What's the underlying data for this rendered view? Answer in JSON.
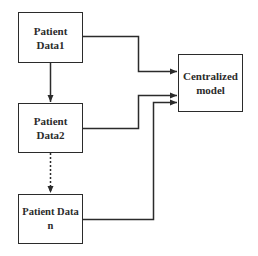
{
  "diagram": {
    "type": "flowchart",
    "nodes": [
      {
        "id": "patient_data_1",
        "label": "Patient\nData1"
      },
      {
        "id": "patient_data_2",
        "label": "Patient\nData2"
      },
      {
        "id": "patient_data_n",
        "label": "Patient Data\nn"
      },
      {
        "id": "centralized_model",
        "label": "Centralized\nmodel"
      }
    ],
    "edges": [
      {
        "from": "patient_data_1",
        "to": "patient_data_2",
        "style": "solid",
        "arrow": true
      },
      {
        "from": "patient_data_2",
        "to": "patient_data_n",
        "style": "dotted",
        "arrow": true
      },
      {
        "from": "patient_data_1",
        "to": "centralized_model",
        "style": "solid",
        "arrow": true
      },
      {
        "from": "patient_data_2",
        "to": "centralized_model",
        "style": "solid",
        "arrow": true
      },
      {
        "from": "patient_data_n",
        "to": "centralized_model",
        "style": "solid",
        "arrow": true
      }
    ],
    "colors": {
      "stroke": "#2b2b2b",
      "background": "#ffffff",
      "text": "#2b2b2b"
    }
  }
}
